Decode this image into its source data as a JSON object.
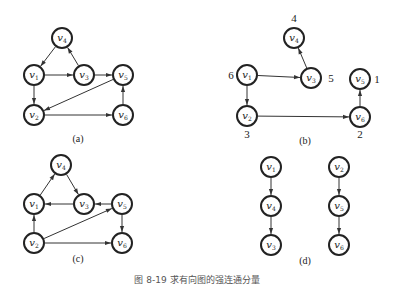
{
  "figure": {
    "caption": "图 8-19  求有向图的强连通分量",
    "node_radius": 10,
    "colors": {
      "stroke": "#222222",
      "edge": "#333333",
      "background": "#ffffff"
    }
  },
  "panels": [
    {
      "id": "a",
      "label": "(a)",
      "label_pos": [
        78,
        142
      ],
      "nodes": [
        {
          "id": "v4",
          "name": "v",
          "sub": "4",
          "x": 62,
          "y": 38
        },
        {
          "id": "v1",
          "name": "v",
          "sub": "1",
          "x": 34,
          "y": 75
        },
        {
          "id": "v3",
          "name": "v",
          "sub": "3",
          "x": 84,
          "y": 75
        },
        {
          "id": "v5",
          "name": "v",
          "sub": "5",
          "x": 123,
          "y": 75
        },
        {
          "id": "v2",
          "name": "v",
          "sub": "2",
          "x": 34,
          "y": 115
        },
        {
          "id": "v6",
          "name": "v",
          "sub": "6",
          "x": 123,
          "y": 115
        }
      ],
      "edges": [
        [
          "v4",
          "v1"
        ],
        [
          "v1",
          "v3"
        ],
        [
          "v3",
          "v4"
        ],
        [
          "v3",
          "v5"
        ],
        [
          "v1",
          "v2"
        ],
        [
          "v5",
          "v2"
        ],
        [
          "v2",
          "v6"
        ],
        [
          "v6",
          "v5"
        ]
      ]
    },
    {
      "id": "b",
      "label": "(b)",
      "label_pos": [
        305,
        144
      ],
      "nodes": [
        {
          "id": "v4",
          "name": "v",
          "sub": "4",
          "x": 294,
          "y": 38,
          "order": "4",
          "order_pos": [
            294,
            22
          ]
        },
        {
          "id": "v1",
          "name": "v",
          "sub": "1",
          "x": 247,
          "y": 75,
          "order": "6",
          "order_pos": [
            231,
            79
          ]
        },
        {
          "id": "v3",
          "name": "v",
          "sub": "3",
          "x": 311,
          "y": 78,
          "order": "5",
          "order_pos": [
            331,
            82
          ]
        },
        {
          "id": "v5",
          "name": "v",
          "sub": "5",
          "x": 360,
          "y": 79,
          "order": "1",
          "order_pos": [
            377,
            83
          ]
        },
        {
          "id": "v2",
          "name": "v",
          "sub": "2",
          "x": 247,
          "y": 116,
          "order": "3",
          "order_pos": [
            247,
            138
          ]
        },
        {
          "id": "v6",
          "name": "v",
          "sub": "6",
          "x": 360,
          "y": 117,
          "order": "2",
          "order_pos": [
            360,
            138
          ]
        }
      ],
      "edges": [
        [
          "v1",
          "v3"
        ],
        [
          "v3",
          "v4"
        ],
        [
          "v1",
          "v2"
        ],
        [
          "v2",
          "v6"
        ],
        [
          "v6",
          "v5"
        ]
      ]
    },
    {
      "id": "c",
      "label": "(c)",
      "label_pos": [
        78,
        262
      ],
      "nodes": [
        {
          "id": "v4",
          "name": "v",
          "sub": "4",
          "x": 61,
          "y": 165
        },
        {
          "id": "v1",
          "name": "v",
          "sub": "1",
          "x": 34,
          "y": 204
        },
        {
          "id": "v3",
          "name": "v",
          "sub": "3",
          "x": 84,
          "y": 204
        },
        {
          "id": "v5",
          "name": "v",
          "sub": "5",
          "x": 122,
          "y": 204
        },
        {
          "id": "v2",
          "name": "v",
          "sub": "2",
          "x": 34,
          "y": 243
        },
        {
          "id": "v6",
          "name": "v",
          "sub": "6",
          "x": 122,
          "y": 243
        }
      ],
      "edges": [
        [
          "v1",
          "v4"
        ],
        [
          "v4",
          "v3"
        ],
        [
          "v3",
          "v1"
        ],
        [
          "v5",
          "v3"
        ],
        [
          "v2",
          "v1"
        ],
        [
          "v2",
          "v5"
        ],
        [
          "v2",
          "v6"
        ],
        [
          "v5",
          "v6"
        ]
      ]
    },
    {
      "id": "d",
      "label": "(d)",
      "label_pos": [
        305,
        264
      ],
      "nodes": [
        {
          "id": "v1",
          "name": "v",
          "sub": "1",
          "x": 271,
          "y": 167
        },
        {
          "id": "v4",
          "name": "v",
          "sub": "4",
          "x": 271,
          "y": 206
        },
        {
          "id": "v3",
          "name": "v",
          "sub": "3",
          "x": 271,
          "y": 245
        },
        {
          "id": "v2",
          "name": "v",
          "sub": "2",
          "x": 339,
          "y": 167
        },
        {
          "id": "v5",
          "name": "v",
          "sub": "5",
          "x": 339,
          "y": 206
        },
        {
          "id": "v6",
          "name": "v",
          "sub": "6",
          "x": 339,
          "y": 245
        }
      ],
      "edges": [
        [
          "v1",
          "v4"
        ],
        [
          "v4",
          "v3"
        ],
        [
          "v2",
          "v5"
        ],
        [
          "v5",
          "v6"
        ]
      ]
    }
  ]
}
